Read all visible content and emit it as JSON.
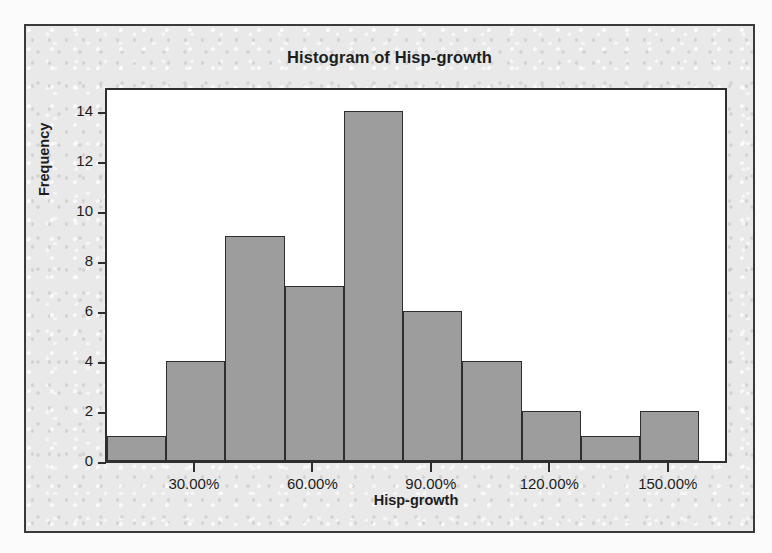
{
  "chart_data": {
    "type": "bar",
    "title": "Histogram of Hisp-growth",
    "xlabel": "Hisp-growth",
    "ylabel": "Frequency",
    "grid": false,
    "legend": false,
    "legend_position": "none",
    "bar_color": "#9d9d9d",
    "bar_edge_color": "#2e2e2e",
    "plot_background": "#ffffff",
    "figure_background": "#e9e9e9",
    "frame_color": "#3a3a3a",
    "text_color": "#1d1d1d",
    "xlim": [
      7.5,
      165.0
    ],
    "ylim": [
      0,
      15
    ],
    "bin_width": 15,
    "x_tick_labels": [
      "30.00%",
      "60.00%",
      "90.00%",
      "120.00%",
      "150.00%"
    ],
    "x_tick_values": [
      30,
      60,
      90,
      120,
      150
    ],
    "y_tick_labels": [
      "0",
      "2",
      "4",
      "6",
      "8",
      "10",
      "12",
      "14"
    ],
    "y_tick_values": [
      0,
      2,
      4,
      6,
      8,
      10,
      12,
      14
    ],
    "bins": [
      {
        "left": 7.5,
        "right": 22.5,
        "center": 15.0,
        "frequency": 1
      },
      {
        "left": 22.5,
        "right": 37.5,
        "center": 30.0,
        "frequency": 4
      },
      {
        "left": 37.5,
        "right": 52.5,
        "center": 45.0,
        "frequency": 9
      },
      {
        "left": 52.5,
        "right": 67.5,
        "center": 60.0,
        "frequency": 7
      },
      {
        "left": 67.5,
        "right": 82.5,
        "center": 75.0,
        "frequency": 14
      },
      {
        "left": 82.5,
        "right": 97.5,
        "center": 90.0,
        "frequency": 6
      },
      {
        "left": 97.5,
        "right": 112.5,
        "center": 105.0,
        "frequency": 4
      },
      {
        "left": 112.5,
        "right": 127.5,
        "center": 120.0,
        "frequency": 2
      },
      {
        "left": 127.5,
        "right": 142.5,
        "center": 135.0,
        "frequency": 1
      },
      {
        "left": 142.5,
        "right": 157.5,
        "center": 150.0,
        "frequency": 2
      }
    ],
    "categories": [
      "15.00%",
      "30.00%",
      "45.00%",
      "60.00%",
      "75.00%",
      "90.00%",
      "105.00%",
      "120.00%",
      "135.00%",
      "150.00%"
    ],
    "values": [
      1,
      4,
      9,
      7,
      14,
      6,
      4,
      2,
      1,
      2
    ],
    "total_count": 50
  }
}
